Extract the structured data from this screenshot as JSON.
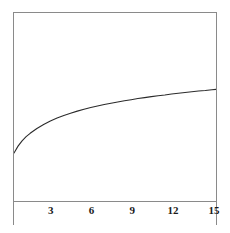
{
  "figure": {
    "background_color": "#ffffff",
    "frame_color": "#8a8a8a",
    "line_color": "#2b2b2b",
    "tick_label_color": "#1a1a1a"
  },
  "chart_data": {
    "type": "line",
    "title": "",
    "subtitle": "",
    "xlabel": "",
    "ylabel": "",
    "grid": false,
    "legend": null,
    "legend_position": "none",
    "annotations": [],
    "xlim": [
      0.3,
      15.3
    ],
    "ylim": [
      0,
      1
    ],
    "xticks": [
      3,
      6,
      9,
      12,
      15
    ],
    "xticklabels": [
      "3",
      "6",
      "9",
      "12",
      "15"
    ],
    "yticks": [],
    "yticklabels": [],
    "series": [
      {
        "name": "curve",
        "x": [
          0.3,
          0.6,
          0.9,
          1.2,
          1.5,
          2.0,
          2.5,
          3.0,
          3.5,
          4.0,
          4.5,
          5.0,
          5.5,
          6.0,
          6.5,
          7.0,
          7.5,
          8.0,
          8.5,
          9.0,
          9.5,
          10.0,
          10.5,
          11.0,
          11.5,
          12.0,
          12.5,
          13.0,
          13.5,
          14.0,
          14.5,
          15.0,
          15.3
        ],
        "y": [
          0.255,
          0.292,
          0.32,
          0.342,
          0.36,
          0.386,
          0.407,
          0.426,
          0.441,
          0.455,
          0.467,
          0.478,
          0.488,
          0.497,
          0.505,
          0.513,
          0.52,
          0.527,
          0.533,
          0.539,
          0.545,
          0.55,
          0.555,
          0.56,
          0.564,
          0.569,
          0.573,
          0.577,
          0.581,
          0.585,
          0.588,
          0.592,
          0.594
        ]
      }
    ]
  }
}
